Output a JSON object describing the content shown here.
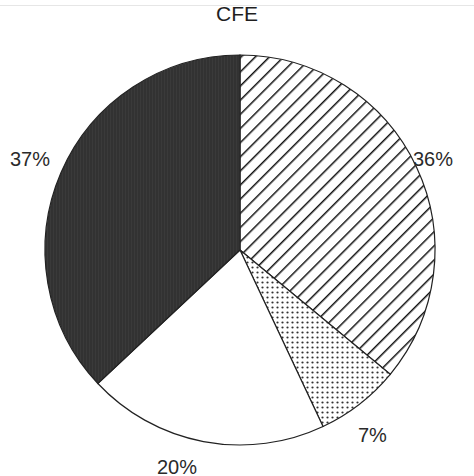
{
  "chart_data": {
    "type": "pie",
    "title": "CFE",
    "categories": [
      "Hatched",
      "Dotted",
      "White",
      "Dark"
    ],
    "values": [
      36,
      7,
      20,
      37
    ],
    "labels": [
      "36%",
      "7%",
      "20%",
      "37%"
    ],
    "start_angle": "12 o'clock",
    "direction": "clockwise",
    "fills": [
      "diagonal-hatch",
      "dot-stipple",
      "#ffffff",
      "#333333"
    ],
    "legend": "none"
  }
}
